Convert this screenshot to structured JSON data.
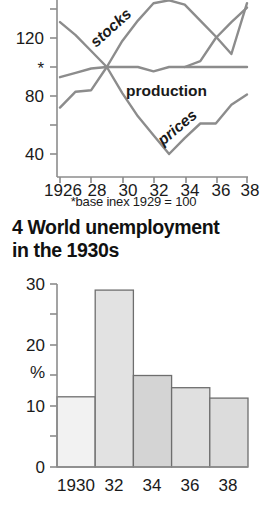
{
  "heading": {
    "line1": "4 World unemployment",
    "line2": "in the 1930s"
  },
  "footnote": "*base inex 1929 = 100",
  "chart_data": [
    {
      "type": "line",
      "title": "",
      "xlabel": "",
      "ylabel": "",
      "ylim": [
        30,
        150
      ],
      "xlim": [
        1926,
        1938
      ],
      "yticks": [
        40,
        80,
        100,
        120
      ],
      "ytick_labels": [
        "40",
        "*",
        "80",
        "120"
      ],
      "ytick_labels_ordered": [
        "120",
        "*",
        "80",
        "40"
      ],
      "xticks": [
        1926,
        1928,
        1930,
        1932,
        1934,
        1936,
        1938
      ],
      "xtick_labels": [
        "1926",
        "28",
        "30",
        "32",
        "34",
        "36",
        "38"
      ],
      "grid": false,
      "legend": "inline-annotations",
      "annotations": [
        {
          "text": "stocks",
          "x": 1929.9,
          "y": 126,
          "rotation": -42
        },
        {
          "text": "production",
          "x": 1931.6,
          "y": 92,
          "rotation": 0
        },
        {
          "text": "prices",
          "x": 1933.1,
          "y": 58,
          "rotation": -40
        }
      ],
      "series": [
        {
          "name": "stocks",
          "x": [
            1926,
            1927,
            1928,
            1929,
            1930,
            1931,
            1932,
            1933,
            1934,
            1935,
            1936,
            1937,
            1938
          ],
          "values": [
            72,
            83,
            84,
            100,
            118,
            132,
            144,
            146,
            143,
            132,
            121,
            109,
            144
          ]
        },
        {
          "name": "production",
          "x": [
            1926,
            1927,
            1928,
            1929,
            1930,
            1931,
            1932,
            1933,
            1934,
            1935,
            1936,
            1937,
            1938
          ],
          "values": [
            93,
            96,
            99,
            100,
            100,
            100,
            97,
            100,
            100,
            100,
            100,
            100,
            100
          ]
        },
        {
          "name": "prices",
          "x": [
            1926,
            1927,
            1928,
            1929,
            1930,
            1931,
            1932,
            1933,
            1934,
            1935,
            1936,
            1937,
            1938
          ],
          "values": [
            131,
            122,
            111,
            100,
            82,
            66,
            53,
            40,
            51,
            61,
            61,
            74,
            81
          ]
        },
        {
          "name": "unlabelled-descending",
          "x": [
            1934,
            1935,
            1936,
            1937,
            1938
          ],
          "values": [
            100,
            104,
            120,
            131,
            141
          ]
        }
      ]
    },
    {
      "type": "bar",
      "title": "4 World unemployment in the 1930s",
      "xlabel": "",
      "ylabel": "%",
      "ylim": [
        0,
        30
      ],
      "yticks": [
        0,
        5,
        10,
        15,
        20,
        25,
        30
      ],
      "ytick_labels": [
        "0",
        "",
        "10",
        "",
        "20",
        "",
        "30"
      ],
      "categories": [
        "1930",
        "32",
        "34",
        "36",
        "38"
      ],
      "values": [
        11.5,
        29,
        15,
        13,
        11.3
      ],
      "bar_colors": [
        "#f2f2f2",
        "#e2e2e2",
        "#d4d4d4",
        "#e0e0e0",
        "#dcdcdc"
      ],
      "grid": false
    }
  ],
  "colors": {
    "line": "#8c8c8c",
    "axis": "#8c8c8c",
    "bar_stroke": "#6e6e6e",
    "text": "#1a1a1a"
  }
}
